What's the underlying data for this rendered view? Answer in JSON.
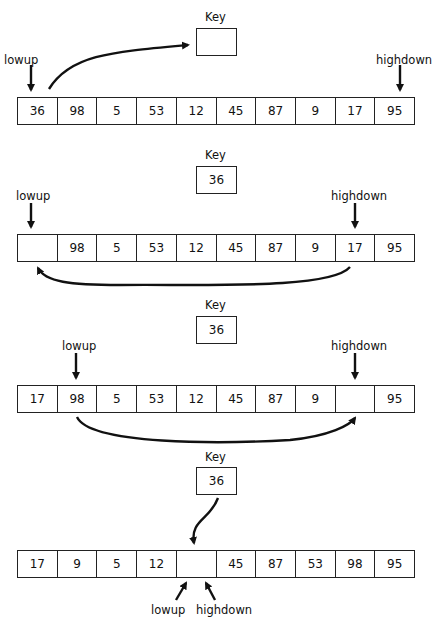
{
  "key_label": "Key",
  "pointer_labels": {
    "low": "lowup",
    "high": "highdown"
  },
  "steps": [
    {
      "key": "",
      "array": [
        "36",
        "98",
        "5",
        "53",
        "12",
        "45",
        "87",
        "9",
        "17",
        "95"
      ]
    },
    {
      "key": "36",
      "array": [
        "",
        "98",
        "5",
        "53",
        "12",
        "45",
        "87",
        "9",
        "17",
        "95"
      ]
    },
    {
      "key": "36",
      "array": [
        "17",
        "98",
        "5",
        "53",
        "12",
        "45",
        "87",
        "9",
        "",
        "95"
      ]
    },
    {
      "key": "36",
      "array": [
        "17",
        "9",
        "5",
        "12",
        "",
        "45",
        "87",
        "53",
        "98",
        "95"
      ]
    }
  ]
}
